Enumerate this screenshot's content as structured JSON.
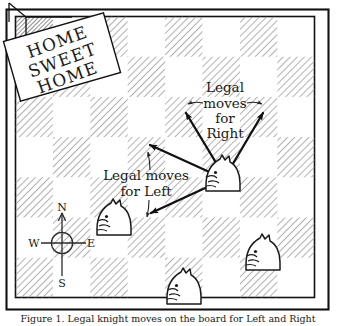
{
  "figure": {
    "kind": "hand-drawn-chessboard-diagram",
    "caption": "Figure 1. Legal knight moves on the board for Left and Right",
    "board": {
      "columns": 8,
      "rows": 7,
      "square_size": 37.6,
      "light_color": "#ffffff",
      "dark_color_hatch": "#9a9a9a",
      "home_square_color": "#8d8d8d",
      "frame_color": "#1a1a1a"
    },
    "sign": {
      "lines": [
        "HOME",
        "SWEET",
        "HOME"
      ],
      "rotation_deg": -16
    },
    "labels": {
      "right_moves": {
        "lines": [
          "Legal",
          "moves",
          "for",
          "Right"
        ],
        "text": "Legal moves for Right"
      },
      "left_moves": {
        "lines": [
          "Legal moves",
          "for Left"
        ],
        "text": "Legal moves for Left"
      }
    },
    "compass": {
      "north": "N",
      "east": "E",
      "south": "S",
      "west": "W"
    },
    "pieces": [
      {
        "name": "knight-active",
        "facing": "left",
        "x": 223,
        "y": 174
      },
      {
        "name": "knight-left-mid",
        "facing": "left",
        "x": 114,
        "y": 218
      },
      {
        "name": "knight-bottom-right",
        "facing": "left",
        "x": 263,
        "y": 253
      },
      {
        "name": "knight-bottom-center",
        "facing": "left",
        "x": 184,
        "y": 287
      }
    ],
    "arrows": [
      {
        "name": "arrow-up-left",
        "group": "right",
        "from": [
          222,
          172
        ],
        "to": [
          185,
          112
        ]
      },
      {
        "name": "arrow-up-right",
        "group": "right",
        "from": [
          230,
          168
        ],
        "to": [
          264,
          112
        ]
      },
      {
        "name": "arrow-left",
        "group": "left",
        "from": [
          216,
          176
        ],
        "to": [
          148,
          144
        ]
      },
      {
        "name": "arrow-down-left",
        "group": "left",
        "from": [
          216,
          184
        ],
        "to": [
          150,
          214
        ]
      }
    ]
  }
}
